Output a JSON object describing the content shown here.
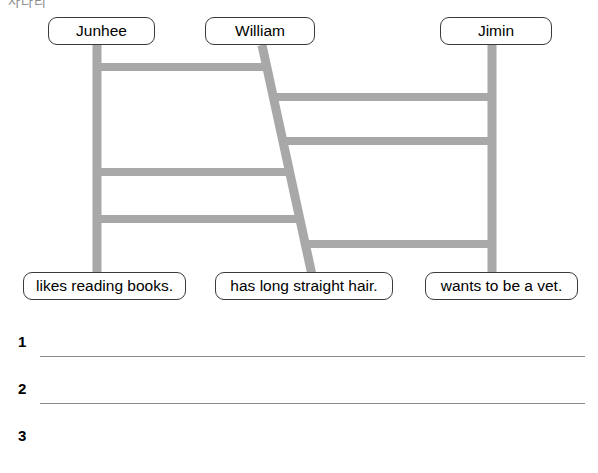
{
  "page": {
    "header_fragment": "사다리",
    "background_color": "#ffffff",
    "ladder_color": "#a8a8a8",
    "box_border_color": "#3a3a3a",
    "rule_color": "#8a8a8a"
  },
  "puzzle": {
    "type": "ladder-game",
    "names": [
      {
        "label": "Junhee"
      },
      {
        "label": "William"
      },
      {
        "label": "Jimin"
      }
    ],
    "statements": [
      {
        "label": "likes reading books."
      },
      {
        "label": "has long straight hair."
      },
      {
        "label": "wants to be a vet."
      }
    ],
    "poles": [
      {
        "name": "left-pole",
        "x_top": 97,
        "x_bottom": 97,
        "y_top": 45,
        "y_bottom": 272
      },
      {
        "name": "middle-pole",
        "x_top": 262,
        "x_bottom": 312,
        "y_top": 45,
        "y_bottom": 272
      },
      {
        "name": "right-pole",
        "x_top": 492,
        "x_bottom": 492,
        "y_top": 45,
        "y_bottom": 272
      }
    ],
    "rungs": [
      {
        "name": "rung-left-1",
        "side": "left",
        "y": 67
      },
      {
        "name": "rung-right-1",
        "side": "right",
        "y": 97
      },
      {
        "name": "rung-right-2",
        "side": "right",
        "y": 141
      },
      {
        "name": "rung-left-2",
        "side": "left",
        "y": 172
      },
      {
        "name": "rung-left-3",
        "side": "left",
        "y": 219
      },
      {
        "name": "rung-right-3",
        "side": "right",
        "y": 244
      }
    ]
  },
  "answers": [
    {
      "number": "1",
      "value": ""
    },
    {
      "number": "2",
      "value": ""
    },
    {
      "number": "3",
      "value": ""
    }
  ]
}
